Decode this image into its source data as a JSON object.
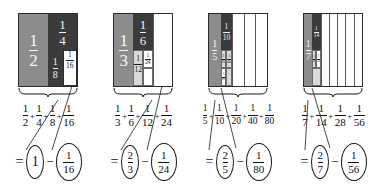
{
  "figure": {
    "colors": {
      "shade_mid": "#8c8c8c",
      "shade_dark": "#3b3b3b",
      "shade_light": "#d9d9d9",
      "shade_white": "#ffffff",
      "ink": "#1a1a1a"
    }
  },
  "groups": [
    {
      "id": "group-1",
      "square": {
        "columns": 2,
        "cells": [
          {
            "label_num": "1",
            "label_den": "2",
            "shade": "mid"
          },
          {
            "label_num": "1",
            "label_den": "4",
            "shade": "dark"
          },
          {
            "label_num": "1",
            "label_den": "8",
            "shade": "dark"
          },
          {
            "label_num": "1",
            "label_den": "16",
            "shade": "white"
          }
        ]
      },
      "sum": {
        "terms": [
          {
            "num": "1",
            "den": "2"
          },
          {
            "num": "1",
            "den": "4"
          },
          {
            "num": "1",
            "den": "8"
          },
          {
            "num": "1",
            "den": "16"
          }
        ],
        "operator": "+"
      },
      "result": {
        "equals": "=",
        "minus": "−",
        "left": {
          "whole": "1"
        },
        "right": {
          "num": "1",
          "den": "16"
        }
      }
    },
    {
      "id": "group-2",
      "square": {
        "columns": 3,
        "cells": [
          {
            "label_num": "1",
            "label_den": "3",
            "shade": "mid"
          },
          {
            "label_num": "1",
            "label_den": "6",
            "shade": "dark"
          },
          {
            "label_num": "1",
            "label_den": "12",
            "shade": "light"
          },
          {
            "label_num": "1",
            "label_den": "24",
            "shade": "white"
          }
        ]
      },
      "sum": {
        "terms": [
          {
            "num": "1",
            "den": "3"
          },
          {
            "num": "1",
            "den": "6"
          },
          {
            "num": "1",
            "den": "12"
          },
          {
            "num": "1",
            "den": "24"
          }
        ],
        "operator": "+"
      },
      "result": {
        "equals": "=",
        "minus": "−",
        "left": {
          "num": "2",
          "den": "3"
        },
        "right": {
          "num": "1",
          "den": "24"
        }
      }
    },
    {
      "id": "group-3",
      "square": {
        "columns": 5,
        "cells": [
          {
            "label_num": "1",
            "label_den": "5",
            "shade": "mid"
          },
          {
            "label_num": "1",
            "label_den": "10",
            "shade": "dark"
          },
          {
            "label_num": "1",
            "label_den": "20",
            "shade": "light"
          },
          {
            "label_num": "1",
            "label_den": "40",
            "shade": "light"
          },
          {
            "label_num": "1",
            "label_den": "80",
            "shade": "white"
          }
        ]
      },
      "sum": {
        "terms": [
          {
            "num": "1",
            "den": "5"
          },
          {
            "num": "1",
            "den": "10"
          },
          {
            "num": "1",
            "den": "20"
          },
          {
            "num": "1",
            "den": "40"
          },
          {
            "num": "1",
            "den": "80"
          }
        ],
        "operator": "+"
      },
      "result": {
        "equals": "=",
        "minus": "−",
        "left": {
          "num": "2",
          "den": "5"
        },
        "right": {
          "num": "1",
          "den": "80"
        }
      }
    },
    {
      "id": "group-4",
      "square": {
        "columns": 7,
        "cells": [
          {
            "label_num": "1",
            "label_den": "7",
            "shade": "mid"
          },
          {
            "label_num": "1",
            "label_den": "14",
            "shade": "dark"
          },
          {
            "label_num": "1",
            "label_den": "28",
            "shade": "light"
          },
          {
            "label_num": "1",
            "label_den": "56",
            "shade": "white"
          }
        ]
      },
      "sum": {
        "terms": [
          {
            "num": "1",
            "den": "7"
          },
          {
            "num": "1",
            "den": "14"
          },
          {
            "num": "1",
            "den": "28"
          },
          {
            "num": "1",
            "den": "56"
          }
        ],
        "operator": "+"
      },
      "result": {
        "equals": "=",
        "minus": "−",
        "left": {
          "num": "2",
          "den": "7"
        },
        "right": {
          "num": "1",
          "den": "56"
        }
      }
    }
  ]
}
